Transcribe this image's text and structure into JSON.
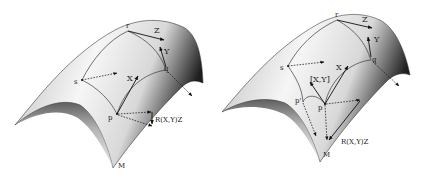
{
  "figures": [
    {
      "id": "left",
      "surface_label": "M",
      "points": {
        "p": "p",
        "q": "q",
        "r": "r",
        "s": "s"
      },
      "vectors": {
        "x": "X",
        "y": "Y",
        "z": "Z"
      },
      "curvature_label": "R(X,Y)Z"
    },
    {
      "id": "right",
      "surface_label": "M",
      "points": {
        "p": "p",
        "p_prime": "p'",
        "q": "q",
        "r": "r",
        "s": "s"
      },
      "vectors": {
        "x": "X",
        "y": "Y",
        "z": "Z",
        "bracket": "[X,Y]"
      },
      "curvature_label": "R(X,Y)Z"
    }
  ],
  "colors": {
    "ink": "#111111",
    "surface_light": "#f4f4f4",
    "surface_dark": "#1e1e1e",
    "background": "#ffffff"
  }
}
